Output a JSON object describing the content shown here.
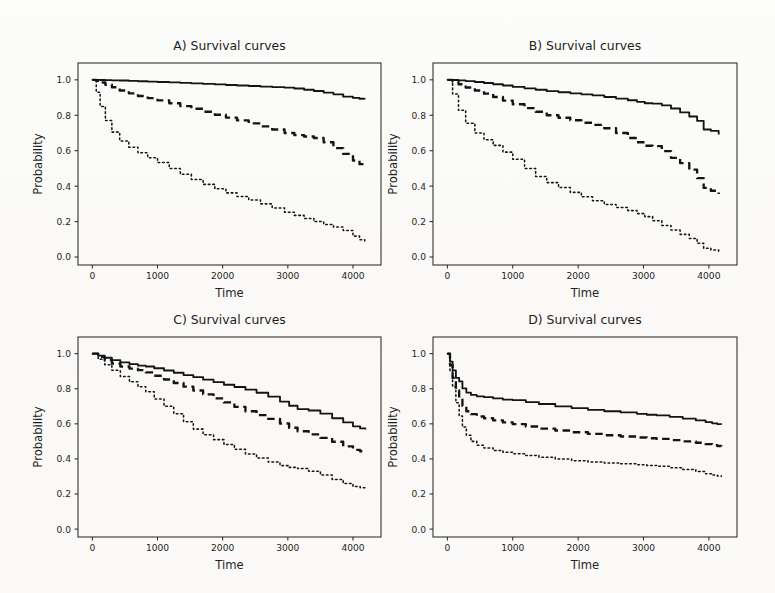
{
  "figure": {
    "layout": "2x2 grid of survival-curve panels",
    "background_color": "#fbfaf8",
    "ink_color": "#141414"
  },
  "axis": {
    "xlabel": "Time",
    "ylabel": "Probability",
    "xticks": [
      0,
      1000,
      2000,
      3000,
      4000
    ],
    "xtick_labels": [
      "0",
      "1000",
      "2000",
      "3000",
      "4000"
    ],
    "yticks": [
      0.0,
      0.2,
      0.4,
      0.6,
      0.8,
      1.0
    ],
    "ytick_labels": [
      "0.0",
      "0.2",
      "0.4",
      "0.6",
      "0.8",
      "1.0"
    ],
    "xlim": [
      -220,
      4430
    ],
    "ylim": [
      -0.045,
      1.095
    ]
  },
  "chart_data": [
    {
      "id": "A",
      "type": "line",
      "title": "A) Survival curves",
      "xlabel": "Time",
      "ylabel": "Probability",
      "xlim": [
        -220,
        4430
      ],
      "ylim": [
        -0.045,
        1.095
      ],
      "grid": false,
      "legend": "none",
      "x": [
        0,
        60,
        120,
        200,
        300,
        420,
        560,
        700,
        850,
        1000,
        1180,
        1350,
        1520,
        1700,
        1880,
        2050,
        2220,
        2400,
        2580,
        2760,
        2950,
        3100,
        3250,
        3400,
        3550,
        3700,
        3850,
        4000,
        4100,
        4180
      ],
      "series": [
        {
          "name": "solid",
          "style": "solid",
          "values": [
            1.0,
            1.0,
            0.999,
            0.998,
            0.997,
            0.996,
            0.994,
            0.992,
            0.99,
            0.988,
            0.986,
            0.983,
            0.98,
            0.977,
            0.974,
            0.971,
            0.968,
            0.965,
            0.962,
            0.959,
            0.956,
            0.951,
            0.944,
            0.937,
            0.928,
            0.918,
            0.905,
            0.898,
            0.893,
            0.89
          ]
        },
        {
          "name": "dashed",
          "style": "dashed",
          "values": [
            1.0,
            0.995,
            0.985,
            0.972,
            0.958,
            0.94,
            0.924,
            0.909,
            0.897,
            0.884,
            0.868,
            0.852,
            0.837,
            0.82,
            0.803,
            0.787,
            0.771,
            0.754,
            0.737,
            0.72,
            0.7,
            0.688,
            0.68,
            0.672,
            0.648,
            0.615,
            0.582,
            0.545,
            0.524,
            0.514
          ]
        },
        {
          "name": "dotted",
          "style": "dotted",
          "values": [
            1.0,
            0.93,
            0.85,
            0.77,
            0.705,
            0.655,
            0.62,
            0.588,
            0.56,
            0.533,
            0.5,
            0.467,
            0.437,
            0.41,
            0.385,
            0.362,
            0.342,
            0.322,
            0.3,
            0.277,
            0.253,
            0.235,
            0.218,
            0.2,
            0.184,
            0.17,
            0.15,
            0.118,
            0.098,
            0.083
          ]
        }
      ]
    },
    {
      "id": "B",
      "type": "line",
      "title": "B) Survival curves",
      "xlabel": "Time",
      "ylabel": "Probability",
      "xlim": [
        -220,
        4430
      ],
      "ylim": [
        -0.045,
        1.095
      ],
      "grid": false,
      "legend": "none",
      "x": [
        0,
        80,
        170,
        280,
        420,
        560,
        700,
        850,
        1000,
        1180,
        1350,
        1520,
        1700,
        1880,
        2050,
        2220,
        2400,
        2580,
        2760,
        2900,
        3020,
        3140,
        3280,
        3420,
        3560,
        3700,
        3820,
        3920,
        4030,
        4150
      ],
      "series": [
        {
          "name": "solid",
          "style": "solid",
          "values": [
            1.0,
            0.999,
            0.997,
            0.993,
            0.988,
            0.982,
            0.975,
            0.968,
            0.96,
            0.952,
            0.944,
            0.936,
            0.93,
            0.924,
            0.918,
            0.912,
            0.903,
            0.894,
            0.885,
            0.876,
            0.868,
            0.866,
            0.856,
            0.838,
            0.816,
            0.793,
            0.768,
            0.72,
            0.712,
            0.692
          ]
        },
        {
          "name": "dashed",
          "style": "dashed",
          "values": [
            1.0,
            0.99,
            0.975,
            0.957,
            0.94,
            0.922,
            0.903,
            0.883,
            0.862,
            0.84,
            0.82,
            0.8,
            0.786,
            0.772,
            0.758,
            0.746,
            0.727,
            0.7,
            0.672,
            0.648,
            0.628,
            0.626,
            0.598,
            0.56,
            0.53,
            0.493,
            0.445,
            0.39,
            0.374,
            0.356
          ]
        },
        {
          "name": "dotted",
          "style": "dotted",
          "values": [
            1.0,
            0.92,
            0.828,
            0.755,
            0.7,
            0.662,
            0.63,
            0.592,
            0.552,
            0.5,
            0.455,
            0.42,
            0.392,
            0.365,
            0.34,
            0.318,
            0.297,
            0.28,
            0.262,
            0.245,
            0.228,
            0.205,
            0.178,
            0.152,
            0.128,
            0.105,
            0.078,
            0.05,
            0.04,
            0.028
          ]
        }
      ]
    },
    {
      "id": "C",
      "type": "line",
      "title": "C) Survival curves",
      "xlabel": "Time",
      "ylabel": "Probability",
      "xlim": [
        -220,
        4430
      ],
      "ylim": [
        -0.045,
        1.095
      ],
      "grid": false,
      "legend": "none",
      "x": [
        0,
        90,
        190,
        300,
        430,
        570,
        700,
        820,
        950,
        1100,
        1250,
        1400,
        1550,
        1700,
        1860,
        2020,
        2180,
        2350,
        2520,
        2700,
        2880,
        3020,
        3150,
        3320,
        3500,
        3680,
        3850,
        4000,
        4110,
        4190
      ],
      "series": [
        {
          "name": "solid",
          "style": "solid",
          "values": [
            1.0,
            0.989,
            0.977,
            0.963,
            0.95,
            0.94,
            0.932,
            0.927,
            0.917,
            0.904,
            0.891,
            0.878,
            0.866,
            0.852,
            0.838,
            0.823,
            0.81,
            0.795,
            0.777,
            0.755,
            0.727,
            0.703,
            0.684,
            0.676,
            0.658,
            0.632,
            0.608,
            0.586,
            0.574,
            0.568
          ]
        },
        {
          "name": "dashed",
          "style": "dashed",
          "values": [
            1.0,
            0.981,
            0.963,
            0.944,
            0.927,
            0.915,
            0.906,
            0.893,
            0.874,
            0.853,
            0.833,
            0.812,
            0.79,
            0.768,
            0.745,
            0.722,
            0.697,
            0.672,
            0.65,
            0.628,
            0.602,
            0.578,
            0.558,
            0.54,
            0.52,
            0.498,
            0.472,
            0.452,
            0.444,
            0.44
          ]
        },
        {
          "name": "dotted",
          "style": "dotted",
          "values": [
            1.0,
            0.968,
            0.937,
            0.905,
            0.87,
            0.84,
            0.812,
            0.783,
            0.742,
            0.7,
            0.658,
            0.612,
            0.57,
            0.538,
            0.51,
            0.482,
            0.455,
            0.428,
            0.405,
            0.382,
            0.362,
            0.352,
            0.345,
            0.33,
            0.308,
            0.283,
            0.26,
            0.243,
            0.236,
            0.232
          ]
        }
      ]
    },
    {
      "id": "D",
      "type": "line",
      "title": "D) Survival curves",
      "xlabel": "Time",
      "ylabel": "Probability",
      "xlim": [
        -220,
        4430
      ],
      "ylim": [
        -0.045,
        1.095
      ],
      "grid": false,
      "legend": "none",
      "x": [
        0,
        40,
        80,
        130,
        180,
        230,
        290,
        360,
        450,
        560,
        700,
        850,
        1000,
        1200,
        1400,
        1650,
        1900,
        2150,
        2400,
        2650,
        2900,
        3050,
        3200,
        3400,
        3600,
        3800,
        3950,
        4050,
        4130,
        4190
      ],
      "series": [
        {
          "name": "solid",
          "style": "solid",
          "values": [
            1.0,
            0.955,
            0.905,
            0.862,
            0.842,
            0.802,
            0.778,
            0.765,
            0.757,
            0.752,
            0.745,
            0.738,
            0.735,
            0.724,
            0.713,
            0.7,
            0.69,
            0.68,
            0.672,
            0.665,
            0.657,
            0.652,
            0.648,
            0.64,
            0.63,
            0.62,
            0.61,
            0.603,
            0.598,
            0.596
          ]
        },
        {
          "name": "dashed",
          "style": "dashed",
          "values": [
            1.0,
            0.935,
            0.862,
            0.79,
            0.745,
            0.702,
            0.672,
            0.655,
            0.642,
            0.632,
            0.62,
            0.608,
            0.598,
            0.585,
            0.573,
            0.562,
            0.552,
            0.543,
            0.535,
            0.528,
            0.522,
            0.518,
            0.514,
            0.507,
            0.5,
            0.492,
            0.484,
            0.478,
            0.474,
            0.472
          ]
        },
        {
          "name": "dotted",
          "style": "dotted",
          "values": [
            1.0,
            0.9,
            0.812,
            0.72,
            0.645,
            0.582,
            0.535,
            0.5,
            0.478,
            0.462,
            0.448,
            0.438,
            0.43,
            0.42,
            0.41,
            0.4,
            0.39,
            0.383,
            0.377,
            0.372,
            0.367,
            0.363,
            0.358,
            0.35,
            0.34,
            0.328,
            0.316,
            0.308,
            0.303,
            0.3
          ]
        }
      ]
    }
  ]
}
